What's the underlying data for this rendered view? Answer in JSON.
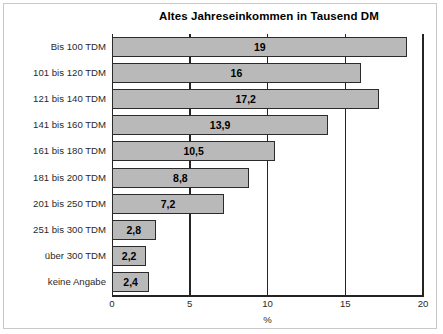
{
  "chart_data": {
    "type": "bar",
    "orientation": "horizontal",
    "title": "Altes Jahreseinkommen in Tausend DM",
    "xlabel": "%",
    "ylabel": "",
    "xlim": [
      0,
      20
    ],
    "xticks": [
      "0",
      "5",
      "10",
      "15",
      "20"
    ],
    "xtick_values": [
      0,
      5,
      10,
      15,
      20
    ],
    "grid": true,
    "legend": "none",
    "categories": [
      "Bis 100 TDM",
      "101 bis 120 TDM",
      "121 bis 140 TDM",
      "141 bis 160 TDM",
      "161 bis 180 TDM",
      "181 bis 200 TDM",
      "201 bis 250 TDM",
      "251 bis 300 TDM",
      "über 300 TDM",
      "keine Angabe"
    ],
    "values": [
      19,
      16,
      17.2,
      13.9,
      10.5,
      8.8,
      7.2,
      2.8,
      2.2,
      2.4
    ],
    "value_labels": [
      "19",
      "16",
      "17,2",
      "13,9",
      "10,5",
      "8,8",
      "7,2",
      "2,8",
      "2,2",
      "2,4"
    ],
    "bar_fill_color": "#b9b9b9",
    "bar_edge_color": "#2b2b2b",
    "axis_color": "#242424",
    "background_color": "#ffffff"
  }
}
